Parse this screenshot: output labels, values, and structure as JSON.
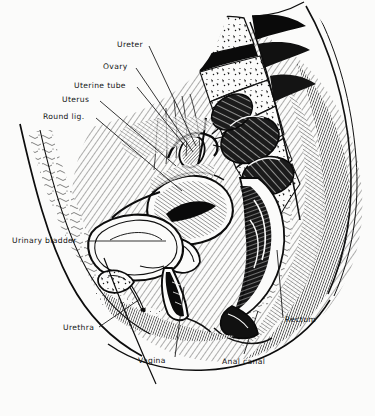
{
  "figure": {
    "style": "black and white engraving / line illustration",
    "background_color": "#fbfbfa",
    "ink_color": "#111111",
    "width": 375,
    "height": 416
  },
  "labels": [
    {
      "id": "ureter",
      "text": "Ureter",
      "x": 117,
      "y": 41,
      "leader": {
        "x1": 149,
        "y1": 46,
        "x2": 196,
        "y2": 146
      }
    },
    {
      "id": "ovary",
      "text": "Ovary",
      "x": 103,
      "y": 63,
      "leader": {
        "x1": 136,
        "y1": 68,
        "x2": 193,
        "y2": 152
      }
    },
    {
      "id": "uterine-tube",
      "text": "Uterine tube",
      "x": 74,
      "y": 82,
      "leader": {
        "x1": 137,
        "y1": 87,
        "x2": 186,
        "y2": 147
      }
    },
    {
      "id": "uterus",
      "text": "Uterus",
      "x": 62,
      "y": 96,
      "leader": {
        "x1": 100,
        "y1": 101,
        "x2": 176,
        "y2": 166
      }
    },
    {
      "id": "round-lig",
      "text": "Round lig.",
      "x": 43,
      "y": 113,
      "leader": {
        "x1": 96,
        "y1": 118,
        "x2": 182,
        "y2": 191
      }
    },
    {
      "id": "urinary-bladder",
      "text": "Urinary bladder",
      "x": 12,
      "y": 237,
      "leader": {
        "x1": 88,
        "y1": 241,
        "x2": 166,
        "y2": 241
      }
    },
    {
      "id": "urethra",
      "text": "Urethra",
      "x": 63,
      "y": 324,
      "leader": {
        "x1": 99,
        "y1": 327,
        "x2": 140,
        "y2": 299
      }
    },
    {
      "id": "vagina",
      "text": "Vagina",
      "x": 138,
      "y": 357,
      "leader": {
        "x1": 175,
        "y1": 357,
        "x2": 184,
        "y2": 287
      }
    },
    {
      "id": "anal-canal",
      "text": "Anal canal",
      "x": 222,
      "y": 358,
      "leader": {
        "x1": 244,
        "y1": 354,
        "x2": 258,
        "y2": 311
      }
    },
    {
      "id": "rectum",
      "text": "Rectum",
      "x": 285,
      "y": 316,
      "leader": {
        "x1": 283,
        "y1": 318,
        "x2": 277,
        "y2": 250
      }
    }
  ]
}
